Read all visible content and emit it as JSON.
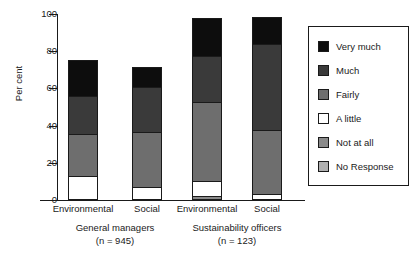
{
  "chart_data": {
    "type": "bar",
    "subtype": "stacked-percentage",
    "title": "",
    "xlabel": "",
    "ylabel": "Per cent",
    "ylim": [
      0,
      100
    ],
    "yticks": [
      0,
      20,
      40,
      60,
      80,
      100
    ],
    "grid": false,
    "legend_position": "right",
    "categories": [
      "Environmental",
      "Social",
      "Environmental",
      "Social"
    ],
    "groups": [
      {
        "label": "General managers",
        "n_label": "(n = 945)",
        "categories": [
          "Environmental",
          "Social"
        ]
      },
      {
        "label": "Sustainability officers",
        "n_label": "(n = 123)",
        "categories": [
          "Environmental",
          "Social"
        ]
      }
    ],
    "series": [
      {
        "name": "Very much",
        "color": "#0d0d0d",
        "values": [
          20,
          11,
          21,
          15
        ]
      },
      {
        "name": "Much",
        "color": "#3a3a3a",
        "values": [
          21,
          25,
          25,
          47
        ]
      },
      {
        "name": "Fairly",
        "color": "#6e6e6e",
        "values": [
          23,
          30,
          43,
          35
        ]
      },
      {
        "name": "A little",
        "color": "#ffffff",
        "values": [
          13,
          7,
          9,
          3
        ]
      },
      {
        "name": "Not at all",
        "color": "#8a8a8a",
        "values": [
          0,
          0,
          2,
          0
        ]
      },
      {
        "name": "No Response",
        "color": "#b0b0b0",
        "values": [
          0,
          0,
          0,
          0
        ]
      }
    ]
  },
  "legend": {
    "items": [
      {
        "label": "Very much"
      },
      {
        "label": "Much"
      },
      {
        "label": "Fairly"
      },
      {
        "label": "A little"
      },
      {
        "label": "Not at all"
      },
      {
        "label": "No Response"
      }
    ]
  },
  "axes": {
    "y_label": "Per cent",
    "y_ticks": [
      "100",
      "80",
      "60",
      "40",
      "20",
      "0"
    ]
  }
}
